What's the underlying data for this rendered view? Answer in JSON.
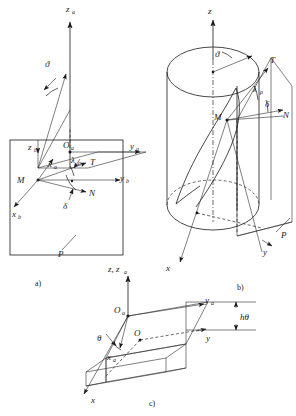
{
  "figure": {
    "title_visible": false,
    "background_color": "#ffffff",
    "line_color": "#1a1a1a",
    "panels": [
      {
        "id": "a",
        "caption": "a)",
        "description": "Tangent plane P with body axes and trajectory vectors",
        "labels": [
          {
            "base": "z",
            "sub": "a",
            "x": 70,
            "y": 11
          },
          {
            "base": "ϑ",
            "sub": "",
            "x": 48,
            "y": 64
          },
          {
            "base": "z",
            "sub": "b",
            "x": 32,
            "y": 148
          },
          {
            "base": "O",
            "sub": "a",
            "x": 67,
            "y": 152
          },
          {
            "base": "y",
            "sub": "a",
            "x": 132,
            "y": 150
          },
          {
            "base": "x",
            "sub": "a",
            "x": 52,
            "y": 167
          },
          {
            "base": "λ",
            "sub": "ρ",
            "x": 75,
            "y": 164
          },
          {
            "base": "T",
            "sub": "",
            "x": 94,
            "y": 166
          },
          {
            "base": "y",
            "sub": "b",
            "x": 124,
            "y": 178
          },
          {
            "base": "M",
            "sub": "",
            "x": 21,
            "y": 180
          },
          {
            "base": "N",
            "sub": "",
            "x": 93,
            "y": 192
          },
          {
            "base": "δ",
            "sub": "",
            "x": 66,
            "y": 205
          },
          {
            "base": "x",
            "sub": "b",
            "x": 17,
            "y": 214
          },
          {
            "base": "P",
            "sub": "",
            "x": 61,
            "y": 253
          }
        ]
      },
      {
        "id": "b",
        "caption": "b)",
        "description": "Cylinder with helical curve, tangent plane P, vectors T and N",
        "labels": [
          {
            "base": "z",
            "sub": "",
            "x": 210,
            "y": 12
          },
          {
            "base": "ϑ",
            "sub": "",
            "x": 218,
            "y": 54
          },
          {
            "base": "T",
            "sub": "",
            "x": 272,
            "y": 65
          },
          {
            "base": "λ",
            "sub": "ρ",
            "x": 258,
            "y": 90
          },
          {
            "base": "δ",
            "sub": "",
            "x": 268,
            "y": 104
          },
          {
            "base": "M",
            "sub": "",
            "x": 219,
            "y": 116
          },
          {
            "base": "N",
            "sub": "",
            "x": 286,
            "y": 114
          },
          {
            "base": "P",
            "sub": "",
            "x": 283,
            "y": 234
          },
          {
            "base": "y",
            "sub": "",
            "x": 266,
            "y": 250
          },
          {
            "base": "x",
            "sub": "",
            "x": 169,
            "y": 268
          }
        ]
      },
      {
        "id": "c",
        "caption": "c)",
        "description": "Developed plane slab showing angle theta and offset h-theta",
        "labels": [
          {
            "base": "z, z",
            "sub": "a",
            "x": 113,
            "y": 268
          },
          {
            "base": "O",
            "sub": "a",
            "x": 122,
            "y": 315
          },
          {
            "base": "y",
            "sub": "a",
            "x": 195,
            "y": 310
          },
          {
            "base": "θ",
            "sub": "",
            "x": 101,
            "y": 340
          },
          {
            "base": "O",
            "sub": "",
            "x": 139,
            "y": 336
          },
          {
            "base": "hθ",
            "sub": "",
            "x": 244,
            "y": 335
          },
          {
            "base": "y",
            "sub": "",
            "x": 209,
            "y": 349
          },
          {
            "base": "x",
            "sub": "a",
            "x": 111,
            "y": 357
          },
          {
            "base": "x",
            "sub": "",
            "x": 94,
            "y": 400
          }
        ]
      }
    ],
    "captions": [
      {
        "text": "a)",
        "x": 38,
        "y": 283
      },
      {
        "text": "b)",
        "x": 240,
        "y": 287
      },
      {
        "text": "c)",
        "x": 152,
        "y": 403
      }
    ]
  }
}
